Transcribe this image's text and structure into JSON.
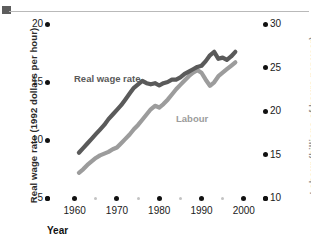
{
  "figure": {
    "top_rule": "decorative-rule",
    "corner_block": "decorative-block"
  },
  "axes": {
    "y_left": {
      "title": "Real wage rate (1992 dollars per hour)",
      "ticks": [
        20,
        15,
        10,
        5
      ],
      "min": 5,
      "max": 20
    },
    "y_right": {
      "title": "Labour (billions of hours per year)",
      "ticks": [
        30,
        25,
        20,
        15,
        10
      ],
      "min": 10,
      "max": 30
    },
    "x": {
      "title": "Year",
      "ticks": [
        1960,
        1970,
        1980,
        1990,
        2000
      ],
      "minor_ticks": [
        1965,
        1975,
        1985,
        1995
      ],
      "min": 1957,
      "max": 2001
    }
  },
  "series_labels": {
    "wage": "Real wage rate",
    "labour": "Labour"
  },
  "colors": {
    "wage_line": "#5a5a5a",
    "labour_line": "#9c9c9c",
    "tick_dot": "#111111",
    "minor_tick_dot": "#c3c3c3",
    "right_axis_title": "#8e8e8e",
    "rule": "#b9b9b9"
  },
  "chart_data": {
    "type": "line",
    "title": "",
    "subtitle": "",
    "xlabel": "Year",
    "ylabel": "Real wage rate (1992 dollars per hour)",
    "y2label": "Labour (billions of hours per year)",
    "xlim": [
      1957,
      2001
    ],
    "ylim": [
      5,
      20
    ],
    "y2lim": [
      10,
      30
    ],
    "grid": false,
    "legend": "inline-labels",
    "annotations": [
      {
        "text": "Real wage rate",
        "x": 1967,
        "y": 16.4,
        "series": "Real wage rate"
      },
      {
        "text": "Labour",
        "x": 1988,
        "y": 12.6,
        "series": "Labour"
      }
    ],
    "x": [
      1961,
      1962,
      1963,
      1964,
      1965,
      1966,
      1967,
      1968,
      1969,
      1970,
      1971,
      1972,
      1973,
      1974,
      1975,
      1976,
      1977,
      1978,
      1979,
      1980,
      1981,
      1982,
      1983,
      1984,
      1985,
      1986,
      1987,
      1988,
      1989,
      1990,
      1991,
      1992,
      1993,
      1994,
      1995,
      1996,
      1997,
      1998
    ],
    "series": [
      {
        "name": "Real wage rate",
        "axis": "left",
        "units": "1992 dollars per hour",
        "color": "#5a5a5a",
        "values": [
          8.9,
          9.3,
          9.7,
          10.1,
          10.5,
          10.9,
          11.3,
          11.8,
          12.2,
          12.6,
          13.0,
          13.5,
          14.0,
          14.5,
          14.8,
          15.1,
          14.9,
          14.8,
          14.9,
          14.7,
          14.9,
          15.0,
          15.2,
          15.2,
          15.4,
          15.7,
          15.9,
          16.1,
          16.3,
          16.4,
          16.8,
          17.3,
          17.6,
          17.0,
          17.1,
          16.9,
          17.2,
          17.6
        ]
      },
      {
        "name": "Labour",
        "axis": "right",
        "units": "billions of hours per year",
        "color": "#9c9c9c",
        "values": [
          12.9,
          13.3,
          13.8,
          14.2,
          14.6,
          14.9,
          15.1,
          15.3,
          15.6,
          15.8,
          16.3,
          16.8,
          17.3,
          17.9,
          18.4,
          19.0,
          19.6,
          20.2,
          20.6,
          20.4,
          20.8,
          21.3,
          21.9,
          22.5,
          23.0,
          23.5,
          24.0,
          24.4,
          24.7,
          24.4,
          23.6,
          22.9,
          23.3,
          24.0,
          24.4,
          24.8,
          25.2,
          25.6
        ]
      }
    ]
  }
}
